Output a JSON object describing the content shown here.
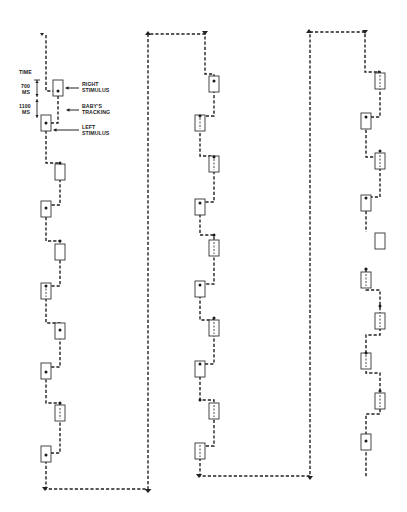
{
  "legend": {
    "time_label": "TIME",
    "interval_1": "700\nMS",
    "interval_1_value": "700",
    "interval_1_unit": "MS",
    "interval_2_value": "1100",
    "interval_2_unit": "MS",
    "right_stimulus": [
      "RIGHT",
      "STIMULUS"
    ],
    "babys_tracking": [
      "BABY'S",
      "TRACKING"
    ],
    "left_stimulus": [
      "LEFT",
      "STIMULUS"
    ]
  },
  "colors": {
    "ink": "#222222",
    "background": "#ffffff"
  },
  "columns": [
    {
      "name": "column-1",
      "left_x": 41,
      "right_x": 55,
      "stimuli": [
        {
          "side": "R",
          "y": 80,
          "dot": "center"
        },
        {
          "side": "L",
          "y": 115,
          "dot": "center"
        },
        {
          "side": "R",
          "y": 164,
          "dot": "center"
        },
        {
          "side": "L",
          "y": 201,
          "dot": "center"
        },
        {
          "side": "R",
          "y": 241,
          "dot": "top"
        },
        {
          "side": "L",
          "y": 283,
          "dot": "none"
        },
        {
          "side": "R",
          "y": 323,
          "dot": "center"
        },
        {
          "side": "L",
          "y": 363,
          "dot": "center"
        },
        {
          "side": "R",
          "y": 403,
          "dot": "top"
        },
        {
          "side": "L",
          "y": 446,
          "dot": "center"
        }
      ]
    },
    {
      "name": "column-2",
      "left_x": 200,
      "right_x": 214,
      "stimuli": [
        {
          "side": "R",
          "y": 75,
          "dot": "center"
        },
        {
          "side": "L",
          "y": 115,
          "dot": "top"
        },
        {
          "side": "R",
          "y": 156,
          "dot": "top"
        },
        {
          "side": "L",
          "y": 199,
          "dot": "center"
        },
        {
          "side": "R",
          "y": 239,
          "dot": "none"
        },
        {
          "side": "L",
          "y": 281,
          "dot": "center"
        },
        {
          "side": "R",
          "y": 320,
          "dot": "none"
        },
        {
          "side": "L",
          "y": 361,
          "dot": "center"
        },
        {
          "side": "R",
          "y": 403,
          "dot": "none"
        },
        {
          "side": "L",
          "y": 443,
          "dot": "none"
        }
      ]
    },
    {
      "name": "column-3",
      "left_x": 366,
      "right_x": 380,
      "stimuli": [
        {
          "side": "R",
          "y": 73,
          "dot": "none"
        },
        {
          "side": "L",
          "y": 113,
          "dot": "center"
        },
        {
          "side": "R",
          "y": 153,
          "dot": "none"
        },
        {
          "side": "L",
          "y": 196,
          "dot": "center"
        },
        {
          "side": "R",
          "y": 233,
          "dot": "none"
        },
        {
          "side": "L",
          "y": 272,
          "dot": "none"
        },
        {
          "side": "R",
          "y": 314,
          "dot": "none"
        },
        {
          "side": "L",
          "y": 353,
          "dot": "top"
        },
        {
          "side": "R",
          "y": 393,
          "dot": "none"
        },
        {
          "side": "L",
          "y": 434,
          "dot": "center"
        }
      ]
    }
  ]
}
